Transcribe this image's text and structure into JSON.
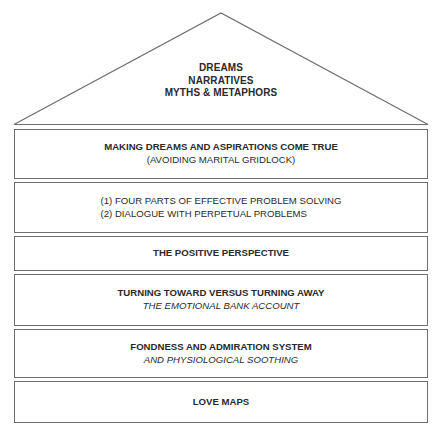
{
  "roof": {
    "lines": [
      "DREAMS",
      "NARRATIVES",
      "MYTHS & METAPHORS"
    ]
  },
  "floors": [
    {
      "title": "MAKING DREAMS AND ASPIRATIONS COME TRUE",
      "subtitle": "(AVOIDING MARITAL GRIDLOCK)"
    },
    {
      "items": [
        "(1) FOUR PARTS OF EFFECTIVE PROBLEM SOLVING",
        "(2) DIALOGUE WITH PERPETUAL PROBLEMS"
      ]
    },
    {
      "title": "THE POSITIVE PERSPECTIVE"
    },
    {
      "title": "TURNING TOWARD VERSUS TURNING AWAY",
      "subtitle": "THE EMOTIONAL BANK ACCOUNT"
    },
    {
      "title": "FONDNESS AND ADMIRATION SYSTEM",
      "subtitle": "AND PHYSIOLOGICAL SOOTHING"
    },
    {
      "title": "LOVE MAPS"
    }
  ],
  "colors": {
    "line": "#6e6e6e",
    "text": "#2a2a2a",
    "background": "#ffffff"
  }
}
